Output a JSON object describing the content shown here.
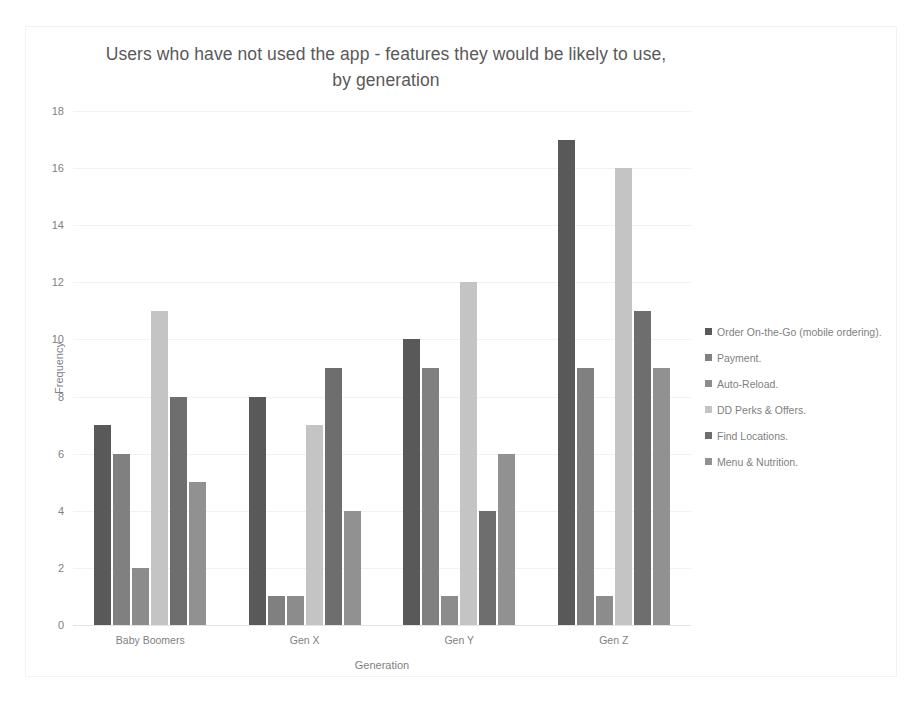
{
  "chart_data": {
    "type": "bar",
    "title": "Users who have not used the app - features they would be likely to use, by generation",
    "title_line1": "Users who have not used the app - features they would be likely to use,",
    "title_line2": "by generation",
    "xlabel": "Generation",
    "ylabel": "Frequency",
    "ylim": [
      0,
      18
    ],
    "ytick_step": 2,
    "yticks": [
      18,
      16,
      14,
      12,
      10,
      8,
      6,
      4,
      2,
      0
    ],
    "grid": true,
    "legend_position": "right",
    "categories": [
      "Baby Boomers",
      "Gen X",
      "Gen Y",
      "Gen Z"
    ],
    "series": [
      {
        "name": "Order On-the-Go (mobile ordering).",
        "color": "#595959",
        "values": [
          7,
          8,
          10,
          17
        ]
      },
      {
        "name": "Payment.",
        "color": "#808080",
        "values": [
          6,
          1,
          9,
          9
        ]
      },
      {
        "name": "Auto-Reload.",
        "color": "#8c8c8c",
        "values": [
          2,
          1,
          1,
          1
        ]
      },
      {
        "name": "DD Perks & Offers.",
        "color": "#c4c4c4",
        "values": [
          11,
          7,
          12,
          16
        ]
      },
      {
        "name": "Find Locations.",
        "color": "#6e6e6e",
        "values": [
          8,
          9,
          4,
          11
        ]
      },
      {
        "name": "Menu & Nutrition.",
        "color": "#919191",
        "values": [
          5,
          4,
          6,
          9
        ]
      }
    ]
  }
}
